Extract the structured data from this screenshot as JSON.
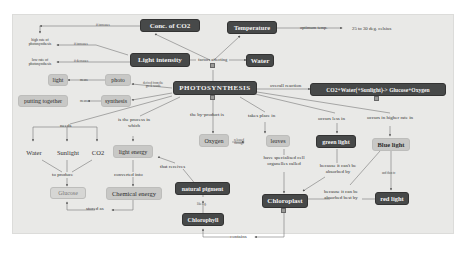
{
  "map": {
    "central": "PHOTOSYNTHESIS",
    "nodes": {
      "conc_co2": "Conc. of CO2",
      "temperature": "Temperature",
      "light_intensity": "Light intensity",
      "water_top": "Water",
      "optimum_value": "25 to 30 deg. celsius",
      "high_rate": "high rate of photosynthesis",
      "low_rate": "low rate of photosynthesis",
      "light": "light",
      "photo": "photo",
      "putting_together": "putting together",
      "synthesis": "synthesis",
      "equation": "CO2+Water(+Sunlight)-> Glucose+Oxygen",
      "water": "Water",
      "sunlight": "Sunlight",
      "co2": "CO2",
      "light_energy": "light energy",
      "glucose": "Glucose",
      "chemical_energy": "Chemical energy",
      "oxygen": "Oxygen",
      "leaves": "leaves",
      "green_light": "green light",
      "blue_light": "Blue light",
      "red_light": "red light",
      "chloroplast": "Chloroplast",
      "natural_pigment": "natural pigment",
      "chlorophyll": "Chlorophyll"
    },
    "links": {
      "factors_affecting": "factors affecting",
      "increases_co2": "if increases",
      "increases_light": "if increases",
      "decreases_light": "if decreases",
      "optimum_temp": "optimum temp.",
      "means_photo": "means",
      "means_synthesis": "means",
      "derived_from": "derived from the greek words",
      "overall_reaction": "overall reaction",
      "needs": "needs",
      "is_the_process": "is the process in which",
      "by_product": "the by-product is",
      "takes_place": "takes place in",
      "occurs_less": "occurs less in",
      "occurs_higher": "occurs in higher rate in",
      "released_through": "released through",
      "to_produce": "to produce",
      "converted_into": "converted into",
      "stored_as": "stored as",
      "that_receives": "that receives",
      "have_specialised": "have specialised cell organelles called",
      "cant_absorbed": "because it can't be absorbed by",
      "absorbed_best": "because it can be absorbed best by",
      "and_then": "and then to",
      "also_known": "like e.g.",
      "contains": "contains"
    }
  }
}
